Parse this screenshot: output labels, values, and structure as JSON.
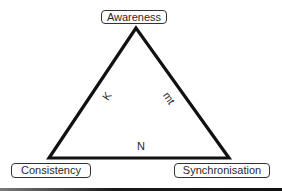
{
  "diagram": {
    "type": "triangle",
    "nodes": [
      {
        "id": "awareness",
        "label": "Awareness",
        "position": "top"
      },
      {
        "id": "consistency",
        "label": "Consistency",
        "position": "bottom-left"
      },
      {
        "id": "synchronisation",
        "label": "Synchronisation",
        "position": "bottom-right"
      }
    ],
    "edges": [
      {
        "from": "awareness",
        "to": "consistency",
        "label": "K"
      },
      {
        "from": "awareness",
        "to": "synchronisation",
        "label": "mt"
      },
      {
        "from": "consistency",
        "to": "synchronisation",
        "label": "N"
      }
    ],
    "colors": {
      "line": "#111111",
      "text": "#2a2a2a",
      "background": "#ffffff"
    }
  }
}
